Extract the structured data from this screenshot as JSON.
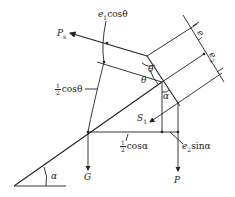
{
  "diagram": {
    "type": "force-diagram",
    "labels": {
      "Ps": {
        "main": "P",
        "sub": "s"
      },
      "e1cos": {
        "prefix": "e",
        "sub": "1",
        "text": "cosθ"
      },
      "e1": {
        "main": "e",
        "sub": "1"
      },
      "e2": {
        "main": "e",
        "sub": "2"
      },
      "theta_upper": "θ",
      "theta_lower": "θ",
      "alpha_upper": "α",
      "alpha_base": "α",
      "half_cos_theta": {
        "num": "1",
        "den": "2",
        "text": "cosθ"
      },
      "half_cos_alpha": {
        "num": "1",
        "den": "2",
        "text": "cosα"
      },
      "S1": {
        "main": "S",
        "sub": "1"
      },
      "G": "G",
      "P": "P",
      "e2sin": {
        "prefix": "e",
        "sub": "2",
        "text": "sinα"
      }
    },
    "colors": {
      "line": "#222222",
      "background": "#ffffff"
    }
  }
}
